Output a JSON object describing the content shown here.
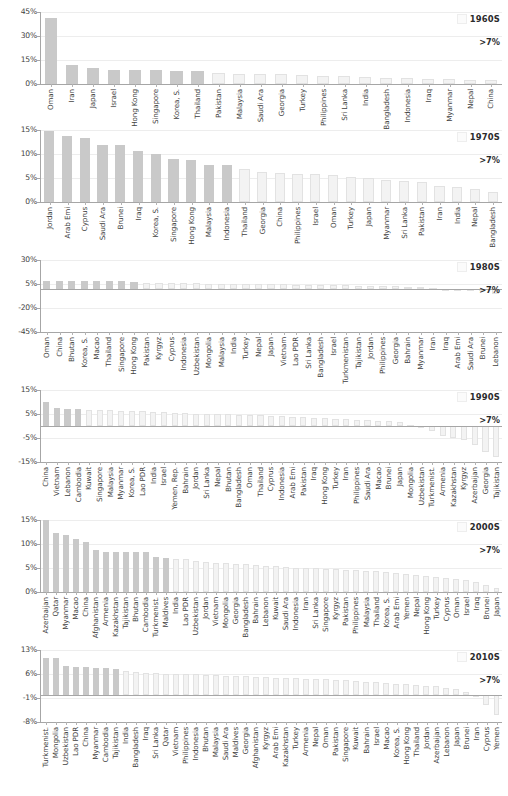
{
  "figure": {
    "title": "",
    "threshold_label": ">7%",
    "bar_color": "#c9c9c9",
    "below_threshold_color": "#f3f3f3",
    "axis_color": "#a6a6a6"
  },
  "chart_data": [
    {
      "type": "bar",
      "title": "1960S",
      "annotation": ">7%",
      "xlabel": "",
      "ylabel": "",
      "ylim": [
        0,
        45
      ],
      "yticks": [
        "0%",
        "15%",
        "30%",
        "45%"
      ],
      "ytick_values": [
        0,
        15,
        30,
        45
      ],
      "grid": true,
      "legend_position": "top-right",
      "threshold": 7,
      "categories": [
        "Oman",
        "Iran",
        "Japan",
        "Israel",
        "Hong Kong",
        "Singapore",
        "Korea, S.",
        "Thailand",
        "Pakistan",
        "Malaysia",
        "Saudi Ara",
        "Georgia",
        "Turkey",
        "Philippines",
        "Sri Lanka",
        "India",
        "Bangladesh",
        "Indonesia",
        "Iraq",
        "Myanmar",
        "Nepal",
        "China"
      ],
      "values": [
        41.0,
        12.0,
        10.0,
        9.0,
        9.0,
        8.6,
        8.4,
        8.0,
        6.8,
        6.5,
        6.3,
        6.0,
        5.6,
        5.2,
        4.8,
        4.4,
        4.0,
        3.8,
        3.4,
        3.0,
        2.6,
        2.2
      ]
    },
    {
      "type": "bar",
      "title": "1970S",
      "annotation": ">7%",
      "xlabel": "",
      "ylabel": "",
      "ylim": [
        0,
        15
      ],
      "yticks": [
        "0%",
        "5%",
        "10%",
        "15%"
      ],
      "ytick_values": [
        0,
        5,
        10,
        15
      ],
      "grid": true,
      "legend_position": "top-right",
      "threshold": 7,
      "categories": [
        "Jordan",
        "Arab Emi",
        "Cyprus",
        "Saudi Ara",
        "Brunei",
        "Iraq",
        "Korea, S.",
        "Singapore",
        "Hong Kong",
        "Malaysia",
        "Indonesia",
        "Thailand",
        "Georgia",
        "China",
        "Philippines",
        "Israel",
        "Oman",
        "Turkey",
        "Japan",
        "Myanmar",
        "Sri Lanka",
        "Pakistan",
        "Iran",
        "India",
        "Nepal",
        "Bangladesh"
      ],
      "values": [
        14.8,
        13.8,
        13.3,
        11.8,
        11.8,
        10.6,
        10.1,
        8.9,
        8.8,
        7.7,
        7.7,
        6.9,
        6.2,
        6.0,
        5.9,
        5.8,
        5.6,
        5.3,
        5.0,
        4.6,
        4.3,
        4.2,
        3.3,
        3.1,
        2.7,
        2.0
      ]
    },
    {
      "type": "bar",
      "title": "1980S",
      "annotation": ">7%",
      "xlabel": "",
      "ylabel": "",
      "ylim": [
        -45,
        30
      ],
      "yticks": [
        "-45%",
        "-20%",
        "5%",
        "30%"
      ],
      "ytick_values": [
        -45,
        -20,
        5,
        30
      ],
      "grid": true,
      "legend_position": "top-right",
      "threshold": 7,
      "categories": [
        "Oman",
        "China",
        "Bhutan",
        "Korea, S.",
        "Macao",
        "Thailand",
        "Singapore",
        "Hong Kong",
        "Pakistan",
        "Kyrgyz",
        "Cyprus",
        "Indonesia",
        "Uzbekistan",
        "Mongolia",
        "Malaysia",
        "India",
        "Turkey",
        "Nepal",
        "Japan",
        "Vietnam",
        "Lao PDR",
        "Sri Lanka",
        "Bangladesh",
        "Israel",
        "Turkmenistan",
        "Tajikistan",
        "Jordan",
        "Philippines",
        "Georgia",
        "Bahrain",
        "Myanmar",
        "Iran",
        "Iraq",
        "Arab Emi",
        "Saudi Ara",
        "Brunei",
        "Lebanon"
      ],
      "values": [
        8.6,
        8.5,
        8.4,
        8.3,
        8.0,
        7.9,
        7.7,
        7.2,
        6.3,
        6.0,
        5.9,
        5.8,
        5.6,
        5.5,
        5.4,
        5.3,
        5.1,
        4.9,
        4.7,
        4.5,
        4.3,
        4.1,
        3.9,
        3.7,
        3.5,
        3.2,
        3.0,
        2.8,
        2.5,
        2.2,
        1.8,
        1.0,
        -0.5,
        -1.5,
        -2.0,
        -2.5,
        -5.0
      ]
    },
    {
      "type": "bar",
      "title": "1990S",
      "annotation": ">7%",
      "xlabel": "",
      "ylabel": "",
      "ylim": [
        -15,
        15
      ],
      "yticks": [
        "-15%",
        "-5%",
        "5%",
        "15%"
      ],
      "ytick_values": [
        -15,
        -5,
        5,
        15
      ],
      "grid": true,
      "legend_position": "top-right",
      "threshold": 7,
      "categories": [
        "China",
        "Vietnam",
        "Lebanon",
        "Cambodia",
        "Kuwait",
        "Singapore",
        "Malaysia",
        "Myanmar",
        "Korea, S.",
        "Lao PDR",
        "India",
        "Israel",
        "Yemen, Rep.",
        "Bahrain",
        "Jordan",
        "Sri Lanka",
        "Nepal",
        "Bhutan",
        "Bangladesh",
        "Oman",
        "Thailand",
        "Cyprus",
        "Indonesia",
        "Arab Emi",
        "Pakistan",
        "Iraq",
        "Hong Kong",
        "Turkey",
        "Iran",
        "Philippines",
        "Saudi Ara",
        "Macao",
        "Brunei",
        "Japan",
        "Mongolia",
        "Uzbekistan",
        "Turkmenist.",
        "Armenia",
        "Kazakhstan",
        "Kyrgyz",
        "Azerbaijan",
        "Georgia",
        "Tajikistan"
      ],
      "values": [
        10.0,
        7.4,
        7.2,
        7.2,
        6.8,
        6.6,
        6.5,
        6.4,
        6.3,
        6.2,
        6.0,
        5.8,
        5.6,
        5.4,
        5.2,
        5.1,
        5.0,
        4.8,
        4.7,
        4.6,
        4.4,
        4.2,
        4.0,
        3.8,
        3.6,
        3.4,
        3.2,
        3.0,
        2.8,
        2.6,
        2.4,
        2.2,
        2.0,
        1.5,
        0.5,
        -0.5,
        -2.0,
        -4.0,
        -5.0,
        -6.0,
        -8.0,
        -11.0,
        -13.0
      ]
    },
    {
      "type": "bar",
      "title": "2000S",
      "annotation": ">7%",
      "xlabel": "",
      "ylabel": "",
      "ylim": [
        0,
        15
      ],
      "yticks": [
        "0%",
        "5%",
        "10%",
        "15%"
      ],
      "ytick_values": [
        0,
        5,
        10,
        15
      ],
      "grid": true,
      "legend_position": "top-right",
      "threshold": 7,
      "categories": [
        "Azerbaijan",
        "Qatar",
        "Myanmar",
        "Macao",
        "China",
        "Afghanistan",
        "Armenia",
        "Kazakhstan",
        "Tajikistan",
        "Bhutan",
        "Cambodia",
        "Turkmenist.",
        "Maldives",
        "India",
        "Lao PDR",
        "Uzbekistan",
        "Jordan",
        "Vietnam",
        "Mongolia",
        "Georgia",
        "Bangladesh",
        "Bahrain",
        "Lebanon",
        "Kuwait",
        "Saudi Ara",
        "Indonesia",
        "Iran",
        "Sri Lanka",
        "Singapore",
        "Kyrgyz",
        "Pakistan",
        "Philippines",
        "Malaysia",
        "Thailand",
        "Korea, S.",
        "Arab Emi",
        "Yemen",
        "Nepal",
        "Hong Kong",
        "Turkey",
        "Cyprus",
        "Oman",
        "Israel",
        "Iraq",
        "Brunei",
        "Japan"
      ],
      "values": [
        16.0,
        12.3,
        11.9,
        11.1,
        10.4,
        8.8,
        8.4,
        8.4,
        8.3,
        8.3,
        8.3,
        7.2,
        7.0,
        6.9,
        6.9,
        6.5,
        6.2,
        6.1,
        6.0,
        5.9,
        5.8,
        5.7,
        5.5,
        5.4,
        5.2,
        5.1,
        5.0,
        4.9,
        4.8,
        4.7,
        4.6,
        4.5,
        4.4,
        4.3,
        4.2,
        4.0,
        3.8,
        3.6,
        3.4,
        3.2,
        3.0,
        2.7,
        2.4,
        2.1,
        1.5,
        0.9
      ]
    },
    {
      "type": "bar",
      "title": "2010S",
      "annotation": ">7%",
      "xlabel": "",
      "ylabel": "",
      "ylim": [
        -8,
        13
      ],
      "yticks": [
        "-8%",
        "-1%",
        "6%",
        "13%"
      ],
      "ytick_values": [
        -8,
        -1,
        6,
        13
      ],
      "grid": true,
      "legend_position": "top-right",
      "threshold": 7,
      "categories": [
        "Turkmenist.",
        "Mongolia",
        "Uzbekistan",
        "Lao PDR",
        "China",
        "Myanmar",
        "Cambodia",
        "Tajikistan",
        "India",
        "Bangladesh",
        "Iraq",
        "Sri Lanka",
        "Qatar",
        "Vietnam",
        "Philippines",
        "Indonesia",
        "Bhutan",
        "Malaysia",
        "Saudi Ara",
        "Maldives",
        "Georgia",
        "Afghanistan",
        "Kyrgyz",
        "Arab Emi",
        "Kazakhstan",
        "Turkey",
        "Armenia",
        "Nepal",
        "Oman",
        "Pakistan",
        "Singapore",
        "Kuwait",
        "Bahrain",
        "Israel",
        "Macao",
        "Korea, S.",
        "Hong Kong",
        "Thailand",
        "Jordan",
        "Azerbaijan",
        "Lebanon",
        "Japan",
        "Brunei",
        "Iran",
        "Cyprus",
        "Yemen"
      ],
      "values": [
        10.8,
        10.7,
        8.2,
        8.1,
        8.1,
        7.8,
        7.7,
        7.5,
        6.8,
        6.5,
        6.4,
        6.2,
        6.1,
        6.1,
        6.0,
        5.9,
        5.8,
        5.6,
        5.5,
        5.4,
        5.3,
        5.2,
        5.0,
        4.9,
        4.8,
        4.7,
        4.6,
        4.5,
        4.4,
        4.3,
        4.2,
        4.0,
        3.8,
        3.6,
        3.4,
        3.2,
        3.0,
        2.8,
        2.6,
        2.4,
        2.0,
        1.6,
        0.8,
        -0.5,
        -3.0,
        -6.0
      ]
    }
  ]
}
